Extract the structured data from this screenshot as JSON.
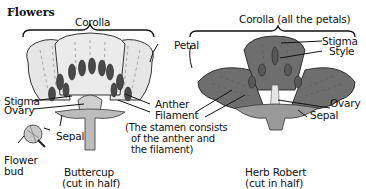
{
  "title": "Flowers",
  "buttercup": {
    "corolla_label": "Corolla",
    "petal_label": "Petal",
    "stigma_label": "Stigma",
    "ovary_label": "Ovary",
    "sepal_label": "Sepal",
    "anther_label": "Anther",
    "filament_label": "Filament",
    "stamen_note_1": "(The stamen consists",
    "stamen_note_2": "of the anther and",
    "stamen_note_3": "the filament)",
    "bud_label_1": "Flower",
    "bud_label_2": "bud",
    "caption_1": "Buttercup",
    "caption_2": "(cut in half)"
  },
  "herb_robert": {
    "corolla_label": "Corolla (all the petals)",
    "stigma_label": "Stigma",
    "style_label": "Style",
    "ovary_label": "Ovary",
    "sepal_label": "Sepal",
    "caption_1": "Herb Robert",
    "caption_2": "(cut in half)"
  },
  "colors": {
    "buttercup_petal": "#e6e6e6",
    "herb_petal": "#6e6e6e",
    "stamen_dark": "#4a4a4a",
    "ink": "#111111"
  }
}
